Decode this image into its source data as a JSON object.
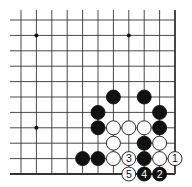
{
  "diagram": {
    "type": "go-board-fragment",
    "corner": "bottom-right",
    "columns": 11,
    "rows": 11,
    "star_points": [
      {
        "col": 1,
        "row": 1
      },
      {
        "col": 7,
        "row": 1
      },
      {
        "col": 1,
        "row": 7
      }
    ],
    "stones": [
      {
        "color": "black",
        "col": 6,
        "row": 5,
        "label": ""
      },
      {
        "color": "black",
        "col": 8,
        "row": 5,
        "label": ""
      },
      {
        "color": "black",
        "col": 5,
        "row": 6,
        "label": ""
      },
      {
        "color": "black",
        "col": 9,
        "row": 6,
        "label": ""
      },
      {
        "color": "black",
        "col": 5,
        "row": 7,
        "label": ""
      },
      {
        "color": "white",
        "col": 6,
        "row": 7,
        "label": ""
      },
      {
        "color": "white",
        "col": 7,
        "row": 7,
        "label": ""
      },
      {
        "color": "white",
        "col": 8,
        "row": 7,
        "label": ""
      },
      {
        "color": "black",
        "col": 9,
        "row": 7,
        "label": ""
      },
      {
        "color": "white",
        "col": 6,
        "row": 8,
        "label": ""
      },
      {
        "color": "black",
        "col": 8,
        "row": 8,
        "label": ""
      },
      {
        "color": "white",
        "col": 9,
        "row": 8,
        "label": ""
      },
      {
        "color": "black",
        "col": 4,
        "row": 9,
        "label": ""
      },
      {
        "color": "black",
        "col": 5,
        "row": 9,
        "label": ""
      },
      {
        "color": "white",
        "col": 6,
        "row": 9,
        "label": ""
      },
      {
        "color": "white",
        "col": 7,
        "row": 9,
        "label": "3"
      },
      {
        "color": "black",
        "col": 8,
        "row": 9,
        "label": ""
      },
      {
        "color": "white",
        "col": 9,
        "row": 9,
        "label": ""
      },
      {
        "color": "white",
        "col": 10,
        "row": 9,
        "label": "1"
      },
      {
        "color": "white",
        "col": 7,
        "row": 10,
        "label": "5"
      },
      {
        "color": "black",
        "col": 8,
        "row": 10,
        "label": "4"
      },
      {
        "color": "black",
        "col": 9,
        "row": 10,
        "label": "2"
      }
    ],
    "colors": {
      "line": "#333333",
      "black_stone": "#111111",
      "white_stone": "#ffffff",
      "background": "#ffffff"
    }
  }
}
